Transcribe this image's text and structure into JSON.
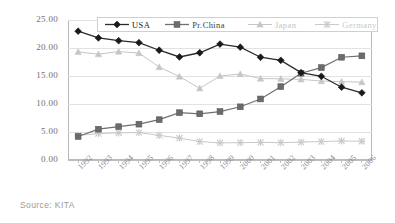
{
  "source_note": "Source: KITA",
  "axis": {
    "y_ticks": [
      "25.00",
      "20.00",
      "15.00",
      "10.00",
      "5.00",
      "0.00"
    ],
    "x_ticks": [
      "1992",
      "1993",
      "1994",
      "1995",
      "1996",
      "1997",
      "1998",
      "1999",
      "2000",
      "2001",
      "2002",
      "2003",
      "2004",
      "2005",
      "2006"
    ]
  },
  "legend": {
    "items": [
      {
        "label": "USA",
        "marker": "diamond-marker",
        "color": "#1a1a1a"
      },
      {
        "label": "Pr.China",
        "marker": "square-marker",
        "color": "#6b6b6b"
      },
      {
        "label": "Japan",
        "marker": "triangle-marker",
        "color": "#c6c6c6"
      },
      {
        "label": "Germany",
        "marker": "cross-marker",
        "color": "#c9c9c9"
      }
    ]
  },
  "chart_data": {
    "type": "line",
    "title": "",
    "subtitle": "",
    "xlabel": "",
    "ylabel": "",
    "ylim": [
      0,
      25
    ],
    "xlim_categories": [
      "1992",
      "1993",
      "1994",
      "1995",
      "1996",
      "1997",
      "1998",
      "1999",
      "2000",
      "2001",
      "2002",
      "2003",
      "2004",
      "2005",
      "2006"
    ],
    "y_tick_values": [
      0,
      5,
      10,
      15,
      20,
      25
    ],
    "grid": "horizontal-major",
    "legend_position": "top-inside",
    "categories": [
      "1992",
      "1993",
      "1994",
      "1995",
      "1996",
      "1997",
      "1998",
      "1999",
      "2000",
      "2001",
      "2002",
      "2003",
      "2004",
      "2005",
      "2006"
    ],
    "series": [
      {
        "name": "USA",
        "marker": "diamond",
        "color": "#1a1a1a",
        "values": [
          23.0,
          21.8,
          21.3,
          20.95,
          19.6,
          18.4,
          19.15,
          20.7,
          20.15,
          18.35,
          17.8,
          15.6,
          14.95,
          13.0,
          12.0
        ]
      },
      {
        "name": "Pr.China",
        "marker": "square",
        "color": "#6b6b6b",
        "values": [
          4.2,
          5.5,
          5.95,
          6.4,
          7.2,
          8.45,
          8.25,
          8.65,
          9.5,
          10.9,
          13.1,
          15.5,
          16.5,
          18.35,
          18.6
        ]
      },
      {
        "name": "Japan",
        "marker": "triangle",
        "color": "#c6c6c6",
        "values": [
          19.3,
          18.9,
          19.35,
          19.1,
          16.6,
          14.9,
          12.8,
          15.0,
          15.35,
          14.55,
          14.5,
          14.4,
          14.1,
          14.0,
          13.9
        ]
      },
      {
        "name": "Germany",
        "marker": "cross",
        "color": "#c9c9c9",
        "values": [
          4.4,
          4.7,
          4.85,
          4.9,
          4.4,
          3.9,
          3.3,
          3.05,
          3.1,
          3.15,
          3.1,
          3.2,
          3.3,
          3.4,
          3.35
        ]
      }
    ]
  }
}
